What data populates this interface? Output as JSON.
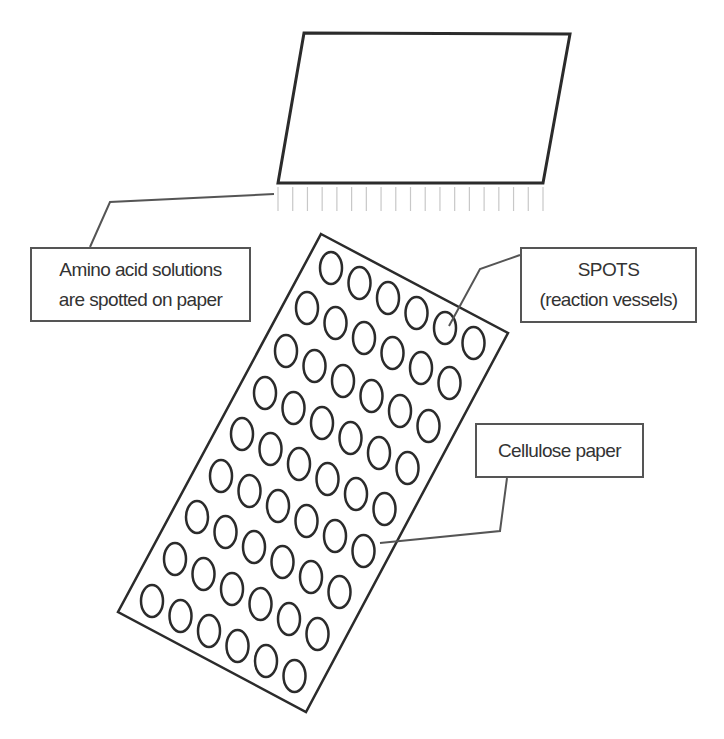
{
  "diagram": {
    "colors": {
      "outline": "#2b2b2b",
      "callout_line": "#555555",
      "pin_line": "#c8c8c8",
      "text": "#333333",
      "background": "#ffffff"
    },
    "spotter_block": {
      "shape": "parallelogram",
      "points": [
        [
          304,
          33
        ],
        [
          570,
          34
        ],
        [
          543,
          183
        ],
        [
          278,
          183
        ]
      ],
      "pins": {
        "count": 19,
        "x_start": 278,
        "x_end": 543,
        "y_top": 187,
        "y_bottom": 211
      }
    },
    "cellulose_sheet": {
      "shape": "rotated-rectangle",
      "points": [
        [
          321,
          234
        ],
        [
          508,
          333
        ],
        [
          306,
          712
        ],
        [
          118,
          612
        ]
      ],
      "spot_grid": {
        "rows": 9,
        "columns": 6,
        "column_step": [
          28.5,
          15
        ],
        "row_starts": [
          [
            331,
            268
          ],
          [
            307,
            308
          ],
          [
            286,
            351
          ],
          [
            265,
            393
          ],
          [
            242,
            434
          ],
          [
            221,
            476
          ],
          [
            197,
            517
          ],
          [
            175,
            559
          ],
          [
            152,
            601
          ]
        ],
        "spot_rx": 11,
        "spot_ry": 16
      }
    },
    "labels": [
      {
        "id": "amino-acid-label",
        "lines": [
          "Amino acid solutions",
          "are spotted on paper"
        ],
        "box": {
          "x": 30,
          "y": 247,
          "w": 221,
          "h": 75
        },
        "callout": [
          [
            274,
            194
          ],
          [
            110,
            202
          ],
          [
            90,
            247
          ]
        ]
      },
      {
        "id": "spots-label",
        "lines": [
          "SPOTS",
          "(reaction vessels)"
        ],
        "box": {
          "x": 520,
          "y": 247,
          "w": 177,
          "h": 76
        },
        "callout": [
          [
            520,
            255
          ],
          [
            480,
            269
          ],
          [
            449,
            326
          ]
        ]
      },
      {
        "id": "cellulose-label",
        "lines": [
          "Cellulose paper"
        ],
        "box": {
          "x": 475,
          "y": 423,
          "w": 169,
          "h": 55
        },
        "callout": [
          [
            507,
            478
          ],
          [
            500,
            531
          ],
          [
            380,
            543
          ]
        ]
      }
    ]
  }
}
